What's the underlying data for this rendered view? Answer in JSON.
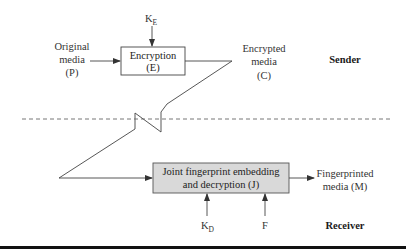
{
  "diagram": {
    "sender": {
      "section_label": "Sender",
      "input_label": [
        "Original",
        "media",
        "(P)"
      ],
      "key_label": {
        "base": "K",
        "sub": "E"
      },
      "encryption_box": [
        "Encryption",
        "(E)"
      ],
      "output_label": [
        "Encrypted",
        "media",
        "(C)"
      ]
    },
    "receiver": {
      "section_label": "Receiver",
      "joint_box": [
        "Joint fingerprint embedding",
        "and decryption (J)"
      ],
      "key_label": {
        "base": "K",
        "sub": "D"
      },
      "fingerprint_label": "F",
      "output_label": [
        "Fingerprinted",
        "media (M)"
      ]
    },
    "colors": {
      "joint_box_fill": "#d9d9d9",
      "encryption_box_fill": "#ffffff",
      "bottom_rule": "#111111"
    }
  }
}
